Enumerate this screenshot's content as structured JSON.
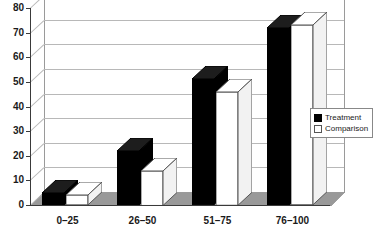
{
  "chart_data": {
    "type": "bar",
    "title": "",
    "subtitle": "",
    "xlabel": "",
    "ylabel": "",
    "categories": [
      "0–25",
      "26–50",
      "51–75",
      "76–100"
    ],
    "series": [
      {
        "name": "Treatment",
        "values": [
          5,
          22,
          51,
          72
        ],
        "color": "#000000"
      },
      {
        "name": "Comparison",
        "values": [
          4,
          14,
          46,
          73
        ],
        "color": "#ffffff"
      }
    ],
    "ylim": [
      0,
      80
    ],
    "ytick_labels": [
      "0",
      "10",
      "20",
      "30",
      "40",
      "50",
      "60",
      "70",
      "80"
    ],
    "ytick_values": [
      0,
      10,
      20,
      30,
      40,
      50,
      60,
      70,
      80
    ],
    "grid": true,
    "grid_axis": "y",
    "legend_position": "right",
    "style": "3d-grouped-bar",
    "legend_entries": [
      {
        "label": "Treatment",
        "swatch": "filled-square"
      },
      {
        "label": "Comparison",
        "swatch": "hollow-square"
      }
    ]
  },
  "legend": {
    "treatment_label": "Treatment",
    "comparison_label": "Comparison"
  },
  "axes": {
    "y_labels": [
      "80",
      "70",
      "60",
      "50",
      "40",
      "30",
      "20",
      "10",
      "0"
    ],
    "x_labels": [
      "0–25",
      "26–50",
      "51–75",
      "76–100"
    ]
  },
  "colors": {
    "treatment": "#000000",
    "comparison": "#ffffff",
    "axis": "#3a3a3a",
    "grid": "#b8b8b8",
    "floor": "#9a9a9a"
  }
}
